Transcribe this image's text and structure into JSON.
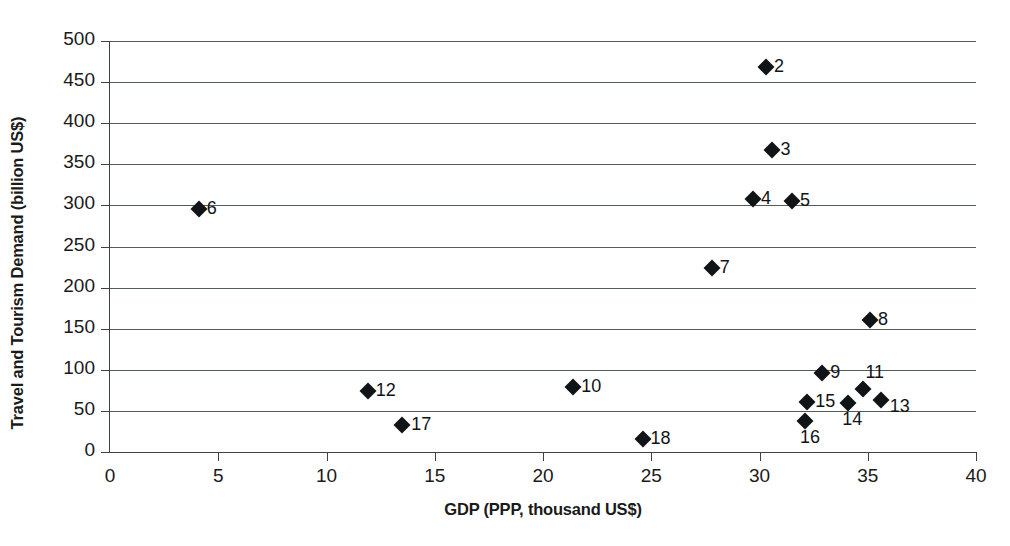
{
  "chart_data": {
    "type": "scatter",
    "title": "",
    "xlabel": "GDP (PPP, thousand US$)",
    "ylabel": "Travel and Tourism Demand (billion US$)",
    "xlim": [
      0,
      40
    ],
    "ylim": [
      0,
      500
    ],
    "xticks": [
      "0",
      "5",
      "10",
      "15",
      "20",
      "25",
      "30",
      "35",
      "40"
    ],
    "yticks": [
      "0",
      "50",
      "100",
      "150",
      "200",
      "250",
      "300",
      "350",
      "400",
      "450",
      "500"
    ],
    "xtick_step": 5,
    "ytick_step": 50,
    "grid": "horizontal",
    "legend": "none",
    "marker": "diamond",
    "marker_color": "#111416",
    "grid_color": "#555a5c",
    "axis_color": "#3d4244",
    "background": "#ffffff",
    "points": [
      {
        "label": "2",
        "x": 30.3,
        "y": 468
      },
      {
        "label": "3",
        "x": 30.6,
        "y": 368
      },
      {
        "label": "4",
        "x": 29.7,
        "y": 308
      },
      {
        "label": "5",
        "x": 31.5,
        "y": 305
      },
      {
        "label": "6",
        "x": 4.1,
        "y": 296
      },
      {
        "label": "7",
        "x": 27.8,
        "y": 224
      },
      {
        "label": "8",
        "x": 35.1,
        "y": 161
      },
      {
        "label": "9",
        "x": 32.9,
        "y": 96
      },
      {
        "label": "10",
        "x": 21.4,
        "y": 79
      },
      {
        "label": "11",
        "x": 34.8,
        "y": 77
      },
      {
        "label": "12",
        "x": 11.9,
        "y": 74
      },
      {
        "label": "13",
        "x": 35.6,
        "y": 63
      },
      {
        "label": "14",
        "x": 34.1,
        "y": 60
      },
      {
        "label": "15",
        "x": 32.2,
        "y": 61
      },
      {
        "label": "16",
        "x": 32.1,
        "y": 38
      },
      {
        "label": "17",
        "x": 13.5,
        "y": 33
      },
      {
        "label": "18",
        "x": 24.6,
        "y": 16
      }
    ],
    "point_label_offsets": {
      "2": {
        "dx": 8,
        "dy": -11
      },
      "3": {
        "dx": 8,
        "dy": -11
      },
      "4": {
        "dx": 8,
        "dy": -11
      },
      "5": {
        "dx": 8,
        "dy": -11
      },
      "6": {
        "dx": 8,
        "dy": -11
      },
      "7": {
        "dx": 8,
        "dy": -11
      },
      "8": {
        "dx": 8,
        "dy": -11
      },
      "9": {
        "dx": 8,
        "dy": -11
      },
      "10": {
        "dx": 8,
        "dy": -11
      },
      "11": {
        "dx": 2,
        "dy": -27
      },
      "12": {
        "dx": 8,
        "dy": -11
      },
      "13": {
        "dx": 9,
        "dy": -4
      },
      "14": {
        "dx": -6,
        "dy": 6
      },
      "15": {
        "dx": 8,
        "dy": -11
      },
      "16": {
        "dx": -5,
        "dy": 6
      },
      "17": {
        "dx": 9,
        "dy": -11
      },
      "18": {
        "dx": 8,
        "dy": -11
      }
    }
  }
}
